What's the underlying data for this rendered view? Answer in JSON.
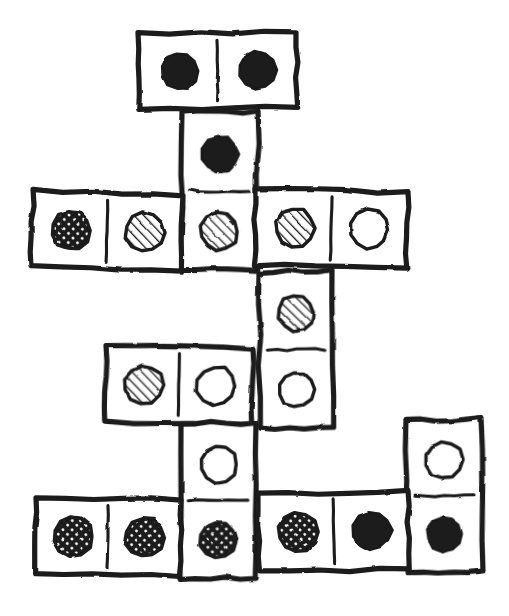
{
  "scene": {
    "title": "Hand-drawn domino chain layout",
    "width": 509,
    "height": 616,
    "background_color": "#ffffff",
    "ink_color": "#1a1a1a",
    "style": "hand-drawn pen sketch",
    "pip_fills": {
      "solid": "#262626",
      "striped": "diagonal-hatch",
      "crosshatch": "cross-hatch-dots",
      "empty": "#ffffff"
    }
  },
  "legend": {
    "fill_names": [
      "solid",
      "striped",
      "crosshatch",
      "empty"
    ],
    "solid_label": "solid black pip",
    "striped_label": "diagonal striped pip",
    "crosshatch_label": "cross-hatched pip",
    "empty_label": "empty outline pip"
  },
  "dominoes": [
    {
      "id": "domino-1",
      "name": "top-horizontal-solid-solid",
      "orientation": "horizontal",
      "x": 138,
      "y": 34,
      "w": 158,
      "h": 75,
      "rotate": -0.6,
      "cells": [
        {
          "fill": "solid",
          "label": "solid"
        },
        {
          "fill": "solid",
          "label": "solid"
        }
      ]
    },
    {
      "id": "domino-2",
      "name": "vertical-solid-striped",
      "orientation": "vertical",
      "x": 182,
      "y": 112,
      "w": 76,
      "h": 158,
      "rotate": 0.4,
      "cells": [
        {
          "fill": "solid",
          "label": "solid"
        },
        {
          "fill": "striped",
          "label": "striped"
        }
      ]
    },
    {
      "id": "domino-3",
      "name": "row2-left-horizontal-crosshatch-striped",
      "orientation": "horizontal",
      "x": 33,
      "y": 191,
      "w": 150,
      "h": 76,
      "rotate": 1.6,
      "cells": [
        {
          "fill": "crosshatch",
          "label": "crosshatch"
        },
        {
          "fill": "striped",
          "label": "striped"
        }
      ]
    },
    {
      "id": "domino-4",
      "name": "row2-right-horizontal-striped-empty",
      "orientation": "horizontal",
      "x": 256,
      "y": 189,
      "w": 152,
      "h": 76,
      "rotate": 1.2,
      "cells": [
        {
          "fill": "striped",
          "label": "striped"
        },
        {
          "fill": "empty",
          "label": "empty"
        }
      ]
    },
    {
      "id": "domino-5",
      "name": "vertical-striped-empty",
      "orientation": "vertical",
      "x": 259,
      "y": 272,
      "w": 73,
      "h": 156,
      "rotate": -0.5,
      "cells": [
        {
          "fill": "striped",
          "label": "striped"
        },
        {
          "fill": "empty",
          "label": "empty"
        }
      ]
    },
    {
      "id": "domino-6",
      "name": "row3-horizontal-striped-empty",
      "orientation": "horizontal",
      "x": 106,
      "y": 346,
      "w": 147,
      "h": 76,
      "rotate": 1.0,
      "cells": [
        {
          "fill": "striped",
          "label": "striped"
        },
        {
          "fill": "empty",
          "label": "empty"
        }
      ]
    },
    {
      "id": "domino-7",
      "name": "vertical-empty-crosshatch",
      "orientation": "vertical",
      "x": 181,
      "y": 423,
      "w": 75,
      "h": 155,
      "rotate": 0.3,
      "cells": [
        {
          "fill": "empty",
          "label": "empty"
        },
        {
          "fill": "crosshatch",
          "label": "crosshatch"
        }
      ]
    },
    {
      "id": "domino-8",
      "name": "right-vertical-empty-solid",
      "orientation": "vertical",
      "x": 406,
      "y": 420,
      "w": 75,
      "h": 152,
      "rotate": -0.8,
      "cells": [
        {
          "fill": "empty",
          "label": "empty"
        },
        {
          "fill": "solid",
          "label": "solid"
        }
      ]
    },
    {
      "id": "domino-9",
      "name": "bottom-left-horizontal-crosshatch-crosshatch",
      "orientation": "horizontal",
      "x": 36,
      "y": 497,
      "w": 145,
      "h": 77,
      "rotate": 1.0,
      "cells": [
        {
          "fill": "crosshatch",
          "label": "crosshatch"
        },
        {
          "fill": "crosshatch",
          "label": "crosshatch"
        }
      ]
    },
    {
      "id": "domino-10",
      "name": "bottom-middle-horizontal-crosshatch-solid",
      "orientation": "horizontal",
      "x": 258,
      "y": 494,
      "w": 150,
      "h": 78,
      "rotate": -1.2,
      "cells": [
        {
          "fill": "crosshatch",
          "label": "crosshatch"
        },
        {
          "fill": "solid",
          "label": "solid"
        }
      ]
    }
  ]
}
